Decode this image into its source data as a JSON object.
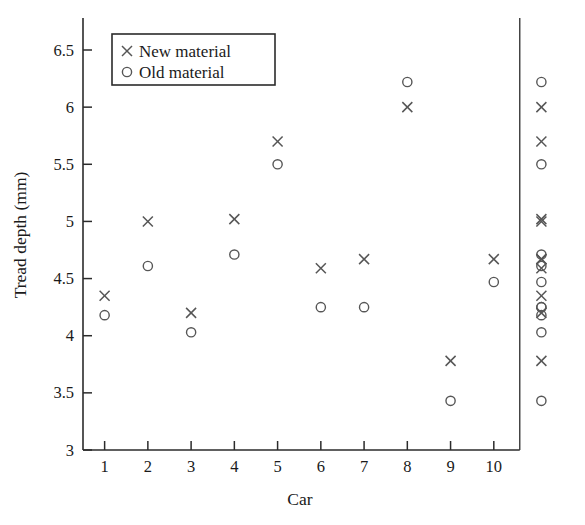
{
  "chart_data": {
    "type": "scatter",
    "title": "",
    "xlabel": "Car",
    "ylabel": "Tread depth (mm)",
    "xlim": [
      0.5,
      11.6
    ],
    "ylim": [
      3,
      6.78
    ],
    "xticks": [
      1,
      2,
      3,
      4,
      5,
      6,
      7,
      8,
      9,
      10
    ],
    "xtick_labels": [
      "1",
      "2",
      "3",
      "4",
      "5",
      "6",
      "7",
      "8",
      "9",
      "10"
    ],
    "yticks": [
      3,
      3.5,
      4,
      4.5,
      5,
      5.5,
      6,
      6.5
    ],
    "ytick_labels": [
      "3",
      "3.5",
      "4",
      "4.5",
      "5",
      "5.5",
      "6",
      "6.5"
    ],
    "grid": false,
    "legend_position": "upper-left",
    "legend_entries": [
      {
        "label": "New material",
        "marker": "cross-marker"
      },
      {
        "label": "Old material",
        "marker": "circle-marker"
      }
    ],
    "categories": [
      "1",
      "2",
      "3",
      "4",
      "5",
      "6",
      "7",
      "8",
      "9",
      "10"
    ],
    "series": [
      {
        "name": "New material",
        "marker": "cross-marker",
        "x": [
          1,
          2,
          3,
          4,
          5,
          6,
          7,
          8,
          9,
          10
        ],
        "values": [
          4.35,
          5.0,
          4.2,
          5.02,
          5.7,
          4.59,
          4.67,
          6.0,
          3.78,
          4.67
        ]
      },
      {
        "name": "Old material",
        "marker": "circle-marker",
        "x": [
          1,
          2,
          3,
          4,
          5,
          6,
          7,
          8,
          9,
          10
        ],
        "values": [
          4.18,
          4.61,
          4.03,
          4.71,
          5.5,
          4.25,
          4.25,
          6.22,
          3.43,
          4.47
        ]
      }
    ],
    "marginal_strip": {
      "x_position": 11.1,
      "divider_x": 10.6,
      "new_material_values": [
        4.35,
        5.0,
        4.2,
        5.02,
        5.7,
        4.59,
        4.67,
        6.0,
        3.78,
        4.67
      ],
      "old_material_values": [
        4.18,
        4.61,
        4.03,
        4.71,
        5.5,
        4.25,
        4.25,
        6.22,
        3.43,
        4.47
      ]
    },
    "annotations": []
  },
  "colors": {
    "marker": "#565656",
    "axis": "#2b2b2b",
    "background": "#ffffff"
  }
}
